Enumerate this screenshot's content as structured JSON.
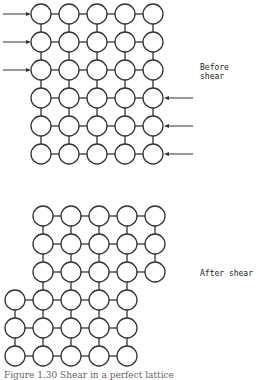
{
  "figure": {
    "before": {
      "label": "Before shear",
      "rows": 6,
      "cols": 5,
      "row_offsets": [
        0,
        0,
        0,
        0,
        0,
        0
      ],
      "left_arrows_rows": [
        0,
        1,
        2
      ],
      "right_arrows_rows": [
        3,
        4,
        5
      ]
    },
    "after": {
      "label": "After shear",
      "rows": 6,
      "cols": 5,
      "row_offsets": [
        0,
        0,
        0,
        -1,
        -1,
        -1
      ]
    },
    "caption": "Figure 1.30 Shear in a perfect lattice",
    "colors": {
      "stroke": "#333333",
      "fill": "#ffffff"
    }
  }
}
